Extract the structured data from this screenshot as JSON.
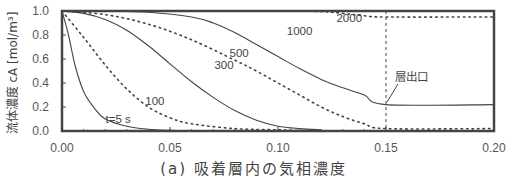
{
  "chart_data": {
    "type": "line",
    "title": "",
    "caption": "(a) 吸着層内の気相濃度",
    "xlabel": "",
    "ylabel": "流体濃度 cA [mol/m³]",
    "xlim": [
      0.0,
      0.2
    ],
    "ylim": [
      0.0,
      1.0
    ],
    "x_ticks": [
      "0.00",
      "0.05",
      "0.10",
      "0.15",
      "0.20"
    ],
    "y_ticks": [
      "0.0",
      "0.2",
      "0.4",
      "0.6",
      "0.8",
      "1.0"
    ],
    "grid": false,
    "legend": "inline curve labels",
    "annotations": [
      {
        "text": "t=5 s",
        "x": 0.026,
        "y": 0.1
      },
      {
        "text": "100",
        "x": 0.043,
        "y": 0.25
      },
      {
        "text": "300",
        "x": 0.075,
        "y": 0.55
      },
      {
        "text": "500",
        "x": 0.082,
        "y": 0.65
      },
      {
        "text": "1000",
        "x": 0.11,
        "y": 0.83
      },
      {
        "text": "2000",
        "x": 0.133,
        "y": 0.94
      },
      {
        "text": "層出口",
        "x": 0.162,
        "y": 0.45
      },
      {
        "text": "bed outlet x = 0.15 (vertical dashed line)",
        "x": 0.15
      }
    ],
    "series": [
      {
        "name": "t=5 s",
        "style": "solid",
        "x": [
          0.0,
          0.003,
          0.006,
          0.01,
          0.015,
          0.02,
          0.03,
          0.04,
          0.05,
          0.06
        ],
        "y": [
          1.0,
          0.8,
          0.55,
          0.33,
          0.19,
          0.1,
          0.04,
          0.015,
          0.005,
          0.0
        ]
      },
      {
        "name": "100 s",
        "style": "dotted",
        "x": [
          0.0,
          0.01,
          0.02,
          0.03,
          0.04,
          0.05,
          0.06,
          0.08,
          0.1,
          0.12
        ],
        "y": [
          1.0,
          0.78,
          0.55,
          0.35,
          0.2,
          0.11,
          0.06,
          0.02,
          0.01,
          0.0
        ]
      },
      {
        "name": "300 s",
        "style": "solid",
        "x": [
          0.0,
          0.01,
          0.02,
          0.03,
          0.04,
          0.05,
          0.06,
          0.07,
          0.08,
          0.09,
          0.1,
          0.11,
          0.12
        ],
        "y": [
          1.0,
          0.98,
          0.93,
          0.84,
          0.71,
          0.56,
          0.41,
          0.28,
          0.17,
          0.09,
          0.04,
          0.02,
          0.01
        ]
      },
      {
        "name": "500 s",
        "style": "dotted",
        "x": [
          0.0,
          0.02,
          0.04,
          0.06,
          0.08,
          0.09,
          0.1,
          0.11,
          0.12,
          0.13,
          0.14,
          0.15,
          0.2
        ],
        "y": [
          1.0,
          0.97,
          0.89,
          0.76,
          0.59,
          0.5,
          0.4,
          0.3,
          0.2,
          0.12,
          0.06,
          0.02,
          0.02
        ]
      },
      {
        "name": "1000 s",
        "style": "solid",
        "x": [
          0.0,
          0.02,
          0.04,
          0.06,
          0.07,
          0.08,
          0.09,
          0.1,
          0.11,
          0.12,
          0.13,
          0.14,
          0.15,
          0.2
        ],
        "y": [
          1.0,
          1.0,
          0.99,
          0.95,
          0.9,
          0.82,
          0.72,
          0.62,
          0.52,
          0.43,
          0.36,
          0.3,
          0.22,
          0.22
        ]
      },
      {
        "name": "2000 s",
        "style": "dotted",
        "x": [
          0.0,
          0.05,
          0.1,
          0.12,
          0.13,
          0.14,
          0.15,
          0.2
        ],
        "y": [
          1.0,
          1.0,
          1.0,
          0.995,
          0.98,
          0.96,
          0.95,
          0.95
        ]
      }
    ]
  }
}
